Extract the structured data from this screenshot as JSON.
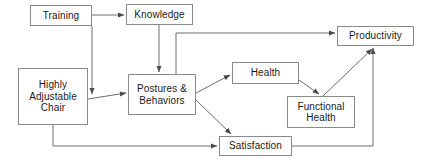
{
  "diagram": {
    "style": {
      "background": "#ffffff",
      "box_border_color": "#8a8a8a",
      "edge_color": "#6e6e6e",
      "text_color": "#1a1a1a"
    },
    "nodes": [
      {
        "id": "training",
        "label": "Training",
        "x": 30,
        "y": 5,
        "w": 62,
        "h": 21
      },
      {
        "id": "knowledge",
        "label": "Knowledge",
        "x": 126,
        "y": 4,
        "w": 67,
        "h": 21
      },
      {
        "id": "chair",
        "label": "Highly\nAdjustable\nChair",
        "x": 18,
        "y": 68,
        "w": 70,
        "h": 57
      },
      {
        "id": "postures",
        "label": "Postures &\nBehaviors",
        "x": 128,
        "y": 74,
        "w": 68,
        "h": 41
      },
      {
        "id": "health",
        "label": "Health",
        "x": 232,
        "y": 62,
        "w": 67,
        "h": 22
      },
      {
        "id": "functional",
        "label": "Functional\nHealth",
        "x": 287,
        "y": 96,
        "w": 68,
        "h": 32
      },
      {
        "id": "satisfaction",
        "label": "Satisfaction",
        "x": 219,
        "y": 136,
        "w": 73,
        "h": 20
      },
      {
        "id": "productivity",
        "label": "Productivity",
        "x": 337,
        "y": 26,
        "w": 77,
        "h": 20
      }
    ],
    "edges": [
      {
        "from": "training",
        "to": "knowledge",
        "label": ""
      },
      {
        "from": "training",
        "to": "postures",
        "label": ""
      },
      {
        "from": "knowledge",
        "to": "postures",
        "label": ""
      },
      {
        "from": "knowledge",
        "to": "productivity",
        "label": ""
      },
      {
        "from": "chair",
        "to": "postures",
        "label": ""
      },
      {
        "from": "chair",
        "to": "satisfaction",
        "label": ""
      },
      {
        "from": "postures",
        "to": "health",
        "label": ""
      },
      {
        "from": "postures",
        "to": "satisfaction",
        "label": ""
      },
      {
        "from": "health",
        "to": "functional",
        "label": ""
      },
      {
        "from": "functional",
        "to": "productivity",
        "label": ""
      },
      {
        "from": "satisfaction",
        "to": "productivity",
        "label": ""
      }
    ]
  }
}
